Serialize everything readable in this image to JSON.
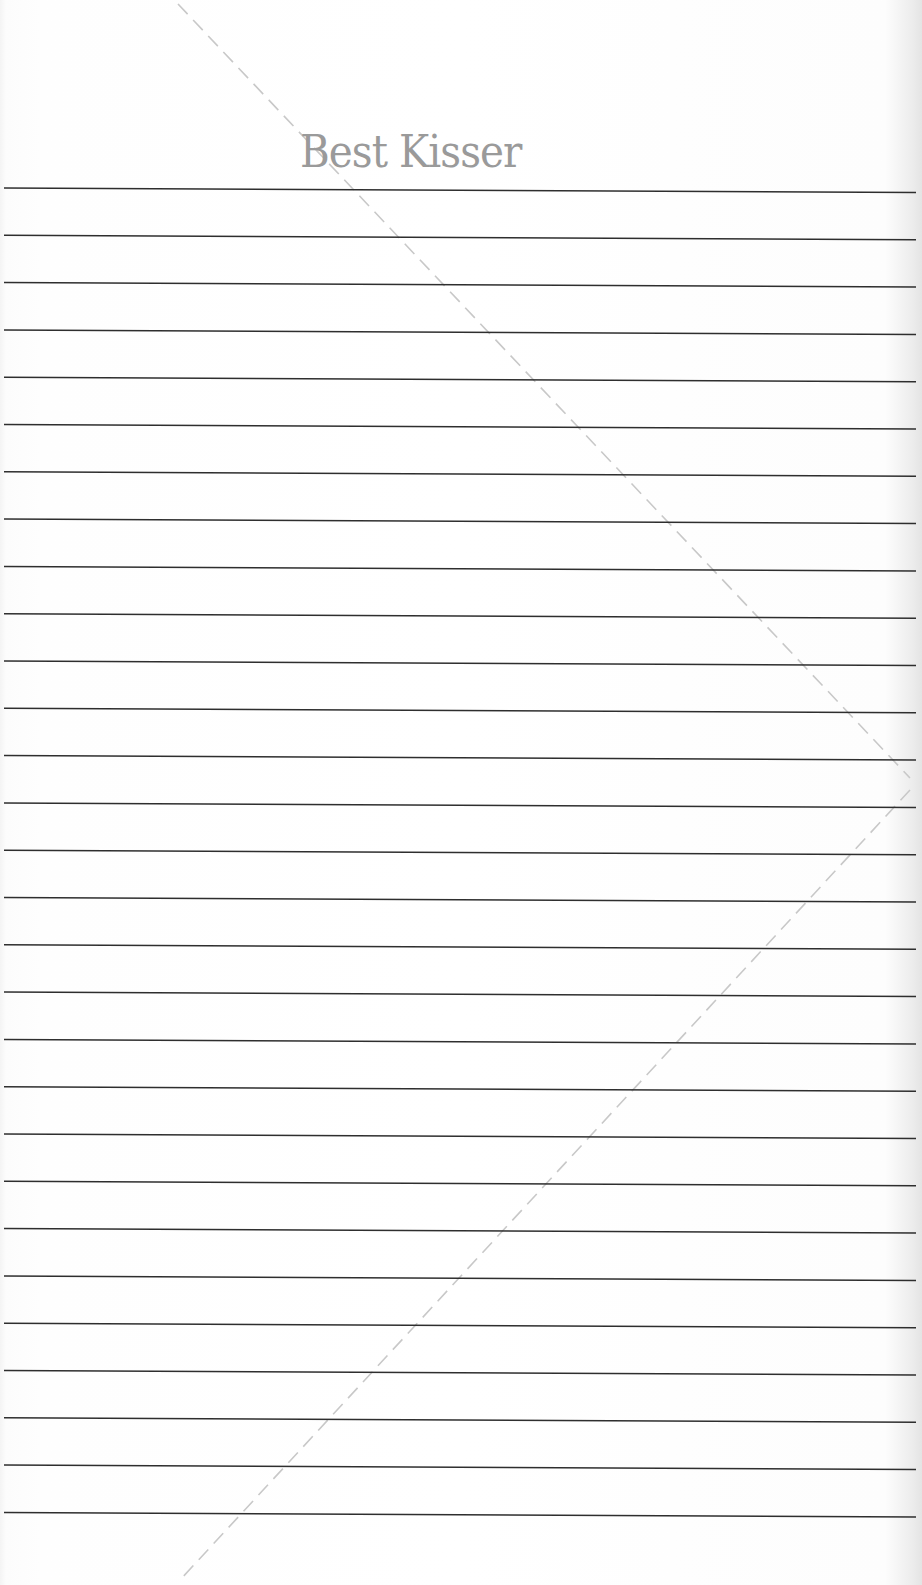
{
  "page": {
    "title": "Best Kisser",
    "line_count": 29,
    "first_line_y": 188,
    "line_spacing": 47.3,
    "colors": {
      "title": "#9a9a9a",
      "rule": "#2e2e2e",
      "fold": "#c4c4c4",
      "paper": "#ffffff"
    }
  }
}
